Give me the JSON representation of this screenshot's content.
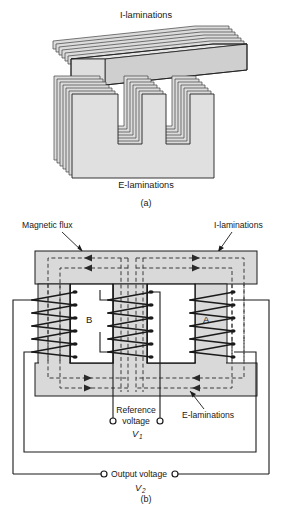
{
  "figure": {
    "title_implicit": "Transformer / LVDT core construction",
    "panels": [
      {
        "id": "a",
        "caption": "(a)",
        "labels": {
          "top": "I-laminations",
          "bottom": "E-laminations"
        }
      },
      {
        "id": "b",
        "caption": "(b)",
        "labels": {
          "magnetic_flux": "Magnetic flux",
          "i_laminations": "I-laminations",
          "e_laminations": "E-laminations",
          "reference_voltage_line1": "Reference",
          "reference_voltage_line2": "voltage",
          "reference_voltage_symbol": "V",
          "reference_voltage_subscript": "1",
          "output_voltage": "Output voltage",
          "output_voltage_symbol": "V",
          "output_voltage_subscript": "2",
          "limb_left": "B",
          "limb_right": "A"
        }
      }
    ]
  },
  "colors": {
    "core_fill": "#d9d9d9",
    "core_fill_light": "#e4e4e4",
    "lamination_edge": "#4a4a4a",
    "outline": "#1a1a1a",
    "flux_dash": "#3a3a3a",
    "background": "#ffffff",
    "wire": "#1a1a1a"
  },
  "geometry": {
    "canvas_width": 292,
    "canvas_height": 505,
    "panel_a_top": 10,
    "panel_b_top": 215,
    "lamination_stack_count": 7,
    "coil_turns_left": 5,
    "coil_turns_center": 5,
    "coil_turns_right": 5,
    "flux_lines_center": 4,
    "terminal_count": 4
  }
}
